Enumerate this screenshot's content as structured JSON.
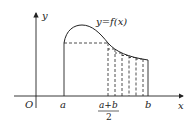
{
  "diagram": {
    "curve_label": "y=f(x)",
    "axis_x_label": "x",
    "axis_y_label": "y",
    "origin_label": "O",
    "a_label": "a",
    "b_label": "b",
    "midpoint_numerator": "a+b",
    "midpoint_denominator": "2",
    "colors": {
      "stroke": "#222222",
      "background": "#ffffff"
    }
  }
}
